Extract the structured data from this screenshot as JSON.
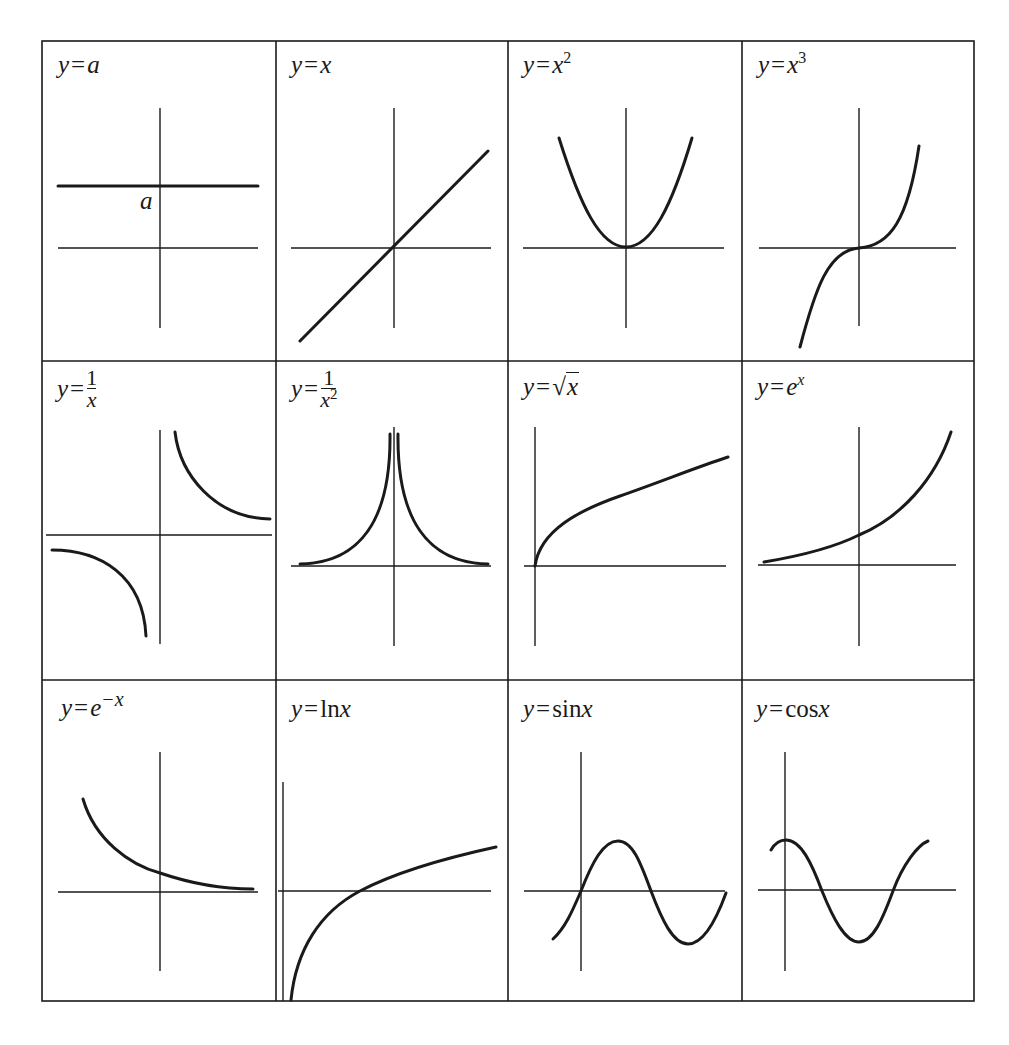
{
  "figure": {
    "grid": {
      "rows": 3,
      "cols": 4
    },
    "colors": {
      "line": "#1a1a1a",
      "background": "#ffffff"
    },
    "cells": [
      {
        "id": "constant",
        "label_text": "y = a",
        "label": {
          "lhs": "y",
          "eq": "=",
          "rhs": "a"
        },
        "annotation": "a"
      },
      {
        "id": "identity",
        "label_text": "y = x",
        "label": {
          "lhs": "y",
          "eq": "=",
          "rhs": "x"
        }
      },
      {
        "id": "square",
        "label_text": "y = x^2",
        "label": {
          "lhs": "y",
          "eq": "=",
          "base": "x",
          "exp": "2"
        }
      },
      {
        "id": "cube",
        "label_text": "y = x^3",
        "label": {
          "lhs": "y",
          "eq": "=",
          "base": "x",
          "exp": "3"
        }
      },
      {
        "id": "reciprocal",
        "label_text": "y = 1/x",
        "label": {
          "lhs": "y",
          "eq": "=",
          "num": "1",
          "den": "x"
        }
      },
      {
        "id": "inverse-square",
        "label_text": "y = 1/x^2",
        "label": {
          "lhs": "y",
          "eq": "=",
          "num": "1",
          "den": "x",
          "den_exp": "2"
        }
      },
      {
        "id": "square-root",
        "label_text": "y = √x",
        "label": {
          "lhs": "y",
          "eq": "=",
          "radical": "√",
          "radicand": "x"
        }
      },
      {
        "id": "exponential",
        "label_text": "y = e^x",
        "label": {
          "lhs": "y",
          "eq": "=",
          "base": "e",
          "exp": "x"
        }
      },
      {
        "id": "exponential-decay",
        "label_text": "y = e^-x",
        "label": {
          "lhs": "y",
          "eq": "=",
          "base": "e",
          "exp": "−x"
        }
      },
      {
        "id": "natural-log",
        "label_text": "y = ln x",
        "label": {
          "lhs": "y",
          "eq": "=",
          "fn": "ln",
          "arg": "x"
        }
      },
      {
        "id": "sine",
        "label_text": "y = sin x",
        "label": {
          "lhs": "y",
          "eq": "=",
          "fn": "sin",
          "arg": "x"
        }
      },
      {
        "id": "cosine",
        "label_text": "y = cos x",
        "label": {
          "lhs": "y",
          "eq": "=",
          "fn": "cos",
          "arg": "x"
        }
      }
    ]
  }
}
